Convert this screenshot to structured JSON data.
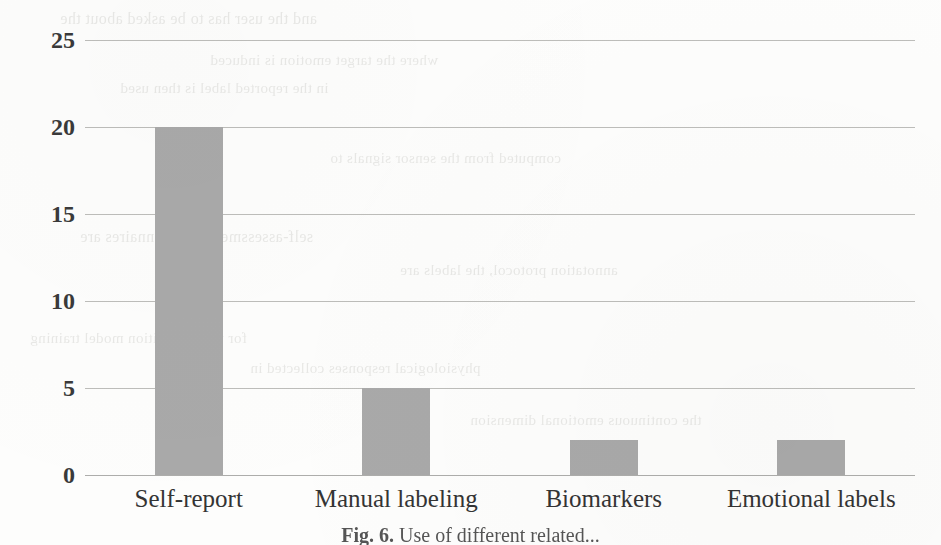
{
  "chart_data": {
    "type": "bar",
    "title": "",
    "xlabel": "",
    "ylabel": "",
    "categories": [
      "Self-report",
      "Manual labeling",
      "Biomarkers",
      "Emotional labels"
    ],
    "values": [
      20,
      5,
      2,
      2
    ],
    "ylim": [
      0,
      25
    ],
    "yticks": [
      0,
      5,
      10,
      15,
      20,
      25
    ],
    "ytick_labels": [
      "0",
      "5",
      "10",
      "15",
      "20",
      "25"
    ],
    "grid": true,
    "grid_axis": "y",
    "legend": "none",
    "bar_color": "#a9a9a9",
    "gridline_color": "#b9b9b6",
    "text_color": "#3a3a3a",
    "background_color": "#fdfdfc"
  },
  "figure": {
    "caption_label": "Fig. 6.",
    "caption_text": " Use of different related..."
  },
  "ghost_text": {
    "lines": [
      "and the user has to be asked about the",
      "where the target emotion is induced",
      "in the reported label is then used",
      "computed from the sensor signals to",
      "self-assessment questionnaires are",
      "annotation protocol, the labels are",
      "for the recognition model training",
      "physiological responses collected in",
      "the continuous emotional dimension"
    ]
  }
}
